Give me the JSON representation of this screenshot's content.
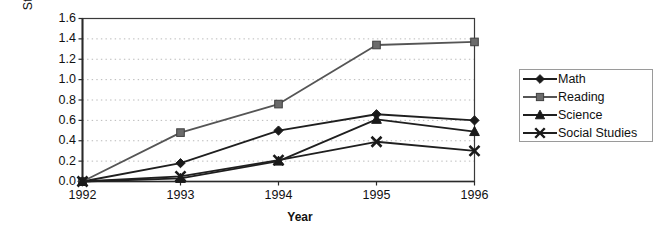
{
  "chart_data": {
    "type": "line",
    "title": "",
    "xlabel": "Year",
    "ylabel": "Standard deviation",
    "categories": [
      "1992",
      "1993",
      "1994",
      "1995",
      "1996"
    ],
    "x": [
      1992,
      1993,
      1994,
      1995,
      1996
    ],
    "ylim": [
      0.0,
      1.6
    ],
    "ytick_labels": [
      "0.0",
      "0.2",
      "0.4",
      "0.6",
      "0.8",
      "1.0",
      "1.2",
      "1.4",
      "1.6"
    ],
    "ytick_values": [
      0.0,
      0.2,
      0.4,
      0.6,
      0.8,
      1.0,
      1.2,
      1.4,
      1.6
    ],
    "grid": "horizontal-dotted",
    "legend_position": "right",
    "series": [
      {
        "name": "Math",
        "marker": "diamond",
        "color": "#1a1a1a",
        "values": [
          0.0,
          0.18,
          0.5,
          0.66,
          0.6
        ]
      },
      {
        "name": "Reading",
        "marker": "square",
        "color": "#6b6b6b",
        "values": [
          0.0,
          0.48,
          0.76,
          1.34,
          1.37
        ]
      },
      {
        "name": "Science",
        "marker": "triangle",
        "color": "#1a1a1a",
        "values": [
          0.0,
          0.03,
          0.2,
          0.61,
          0.49
        ]
      },
      {
        "name": "Social Studies",
        "marker": "cross-x",
        "color": "#1a1a1a",
        "values": [
          0.0,
          0.05,
          0.21,
          0.39,
          0.3
        ]
      }
    ]
  },
  "legend": {
    "items": [
      {
        "label": "Math"
      },
      {
        "label": "Reading"
      },
      {
        "label": "Science"
      },
      {
        "label": "Social Studies"
      }
    ]
  }
}
